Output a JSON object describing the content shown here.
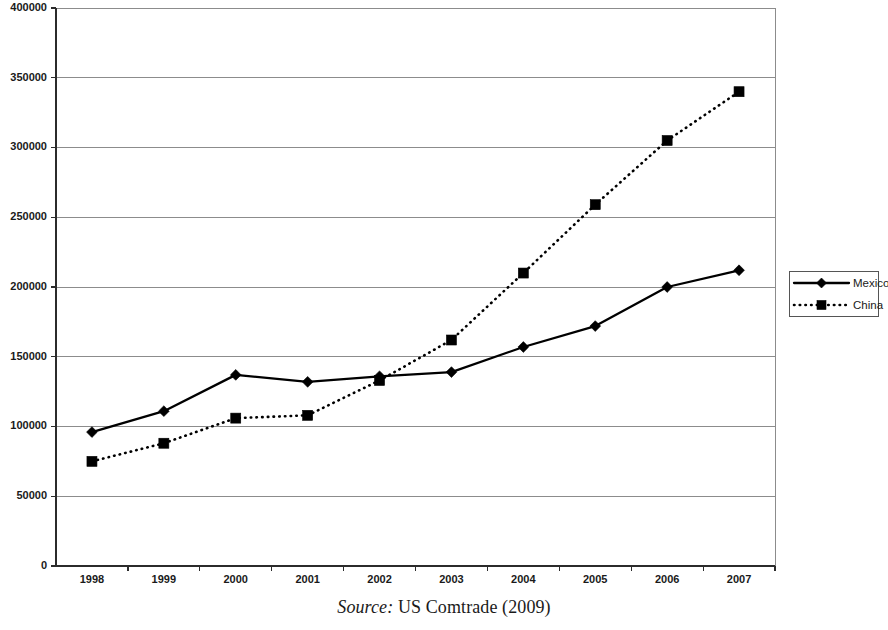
{
  "caption": {
    "source_label": "Source:",
    "source_text": "US Comtrade (2009)"
  },
  "legend": {
    "position": "right",
    "entries": [
      {
        "label": "Mexico",
        "marker": "diamond",
        "line": "solid"
      },
      {
        "label": "China",
        "marker": "square",
        "line": "dotted"
      }
    ]
  },
  "axis": {
    "y_ticks": [
      "0",
      "50000",
      "100000",
      "150000",
      "200000",
      "250000",
      "300000",
      "350000",
      "400000"
    ],
    "x_ticks": [
      "1998",
      "1999",
      "2000",
      "2001",
      "2002",
      "2003",
      "2004",
      "2005",
      "2006",
      "2007"
    ]
  },
  "chart_data": {
    "type": "line",
    "title": "",
    "subtitle": "",
    "xlabel": "",
    "ylabel": "",
    "categories": [
      1998,
      1999,
      2000,
      2001,
      2002,
      2003,
      2004,
      2005,
      2006,
      2007
    ],
    "series": [
      {
        "name": "Mexico",
        "marker": "diamond",
        "linestyle": "solid",
        "color": "#000000",
        "values": [
          96000,
          111000,
          137000,
          132000,
          136000,
          139000,
          157000,
          172000,
          200000,
          212000
        ]
      },
      {
        "name": "China",
        "marker": "square",
        "linestyle": "dotted",
        "color": "#000000",
        "values": [
          75000,
          88000,
          106000,
          108000,
          133000,
          162000,
          210000,
          259000,
          305000,
          340000
        ]
      }
    ],
    "ylim": [
      0,
      400000
    ],
    "ytick_step": 50000,
    "grid": "horizontal",
    "legend_position": "right"
  }
}
